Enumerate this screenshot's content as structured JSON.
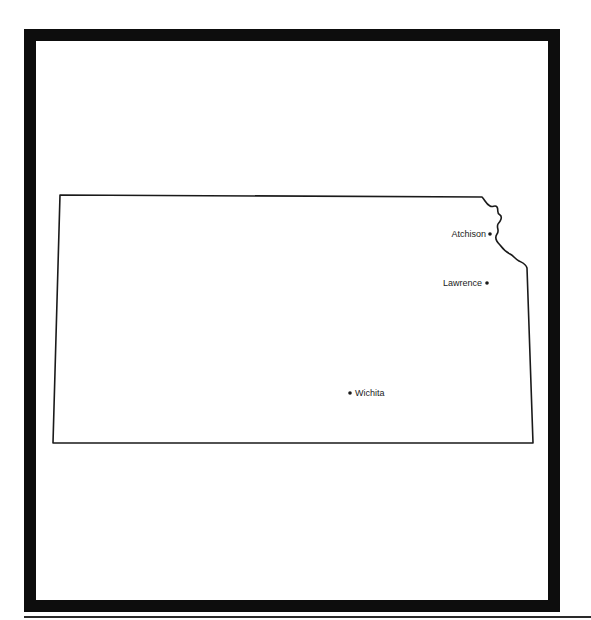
{
  "map": {
    "region": "Kansas",
    "region_type": "state-outline",
    "cities": [
      {
        "name": "Atchison",
        "label_side": "left"
      },
      {
        "name": "Lawrence",
        "label_side": "left"
      },
      {
        "name": "Wichita",
        "label_side": "right"
      }
    ]
  },
  "colors": {
    "frame": "#0d0d0d",
    "outline": "#1a1a1a",
    "background": "#ffffff"
  }
}
